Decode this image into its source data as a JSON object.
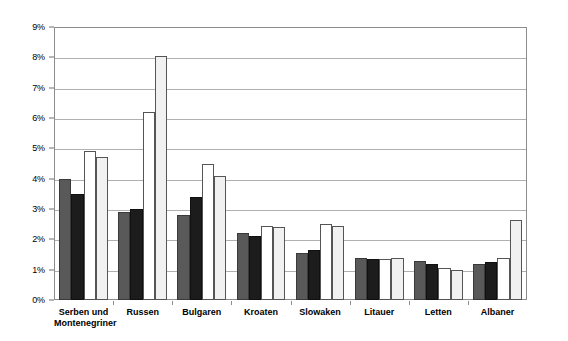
{
  "chart_data": {
    "type": "bar",
    "title": "",
    "subtitle": "",
    "xlabel": "",
    "ylabel": "",
    "ylim": [
      0,
      9
    ],
    "y_tick_labels": [
      "0%",
      "1%",
      "2%",
      "3%",
      "4%",
      "5%",
      "6%",
      "7%",
      "8%",
      "9%"
    ],
    "y_tick_values": [
      0,
      1,
      2,
      3,
      4,
      5,
      6,
      7,
      8,
      9
    ],
    "y_unit": "%",
    "grid": true,
    "legend": "none",
    "categories": [
      "Serben und\nMontenegriner",
      "Russen",
      "Bulgaren",
      "Kroaten",
      "Slowaken",
      "Litauer",
      "Letten",
      "Albaner"
    ],
    "series": [
      {
        "name": "series-1",
        "color": "#595959",
        "values": [
          4.0,
          2.9,
          2.8,
          2.2,
          1.55,
          1.4,
          1.3,
          1.2
        ]
      },
      {
        "name": "series-2",
        "color": "#1c1c1c",
        "values": [
          3.5,
          3.0,
          3.4,
          2.1,
          1.65,
          1.35,
          1.2,
          1.25
        ]
      },
      {
        "name": "series-3",
        "color": "#ffffff",
        "values": [
          4.9,
          6.2,
          4.5,
          2.45,
          2.5,
          1.35,
          1.05,
          1.4
        ]
      },
      {
        "name": "series-4",
        "color": "#f1f1f1",
        "values": [
          4.7,
          8.05,
          4.1,
          2.4,
          2.45,
          1.4,
          1.0,
          2.65
        ]
      }
    ]
  }
}
